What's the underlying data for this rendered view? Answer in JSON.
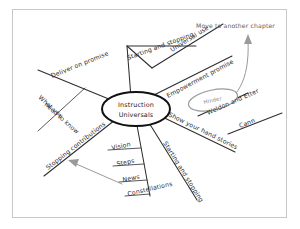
{
  "document": {
    "type": "hand-drawn mind map",
    "title": "Instruction Universals mind map",
    "background_color": "#ffffff",
    "frame_color": "#c9c9c9",
    "ink_color": "#2b2b2b",
    "accent_gray": "#9a9a9a"
  },
  "center": {
    "line1": "Instruction",
    "line2": "Universals"
  },
  "branches": [
    {
      "id": "deliver-on-promise",
      "label": "Deliver on promise"
    },
    {
      "id": "what-you-need-to-know",
      "label_line1": "What you",
      "label_line2": "need to know"
    },
    {
      "id": "stopping-contributions",
      "label": "Stopping contributions"
    },
    {
      "id": "starting-and-stopping-top",
      "label": "Starting and stopping"
    },
    {
      "id": "universal-use",
      "label": "Universal use"
    },
    {
      "id": "empowerment-promise",
      "label": "Empowerment promise"
    },
    {
      "id": "show-your-hand-stories",
      "label": "Show your hand stories"
    },
    {
      "id": "weldon-and-etter",
      "label": "Weldon and Etter"
    },
    {
      "id": "cann",
      "label": "Cann"
    },
    {
      "id": "starting-and-stopping-lower",
      "label": "Starting and stopping"
    },
    {
      "id": "vision",
      "label": "Vision"
    },
    {
      "id": "steps",
      "label": "Steps"
    },
    {
      "id": "news",
      "label": "News"
    },
    {
      "id": "constellations",
      "label": "Constellations"
    }
  ],
  "sub_node": {
    "label": "Hinder"
  },
  "annotations": [
    {
      "id": "move-to-another-chapter",
      "label": "Move to another chapter"
    }
  ]
}
